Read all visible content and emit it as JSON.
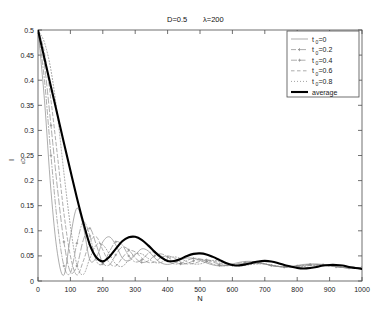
{
  "chart_data": {
    "type": "line",
    "title": "D=0.5  λ=200",
    "title_parts": {
      "d_label": "D=0.5",
      "lambda_label": "λ=200"
    },
    "xlabel": "N",
    "ylabel": "I",
    "ylabel_sub": "εD",
    "xlim": [
      0,
      1000
    ],
    "ylim": [
      0,
      0.5
    ],
    "grid": false,
    "legend_position": "top-right",
    "xticks": [
      0,
      100,
      200,
      300,
      400,
      500,
      600,
      700,
      800,
      900,
      1000
    ],
    "xtick_labels": [
      "0",
      "100",
      "200",
      "300",
      "400",
      "500",
      "600",
      "700",
      "800",
      "900",
      "1000"
    ],
    "yticks": [
      0,
      0.05,
      0.1,
      0.15,
      0.2,
      0.25,
      0.3,
      0.35,
      0.4,
      0.45,
      0.5
    ],
    "ytick_labels": [
      "0",
      "0.05",
      "0.1",
      "0.15",
      "0.2",
      "0.25",
      "0.3",
      "0.35",
      "0.4",
      "0.45",
      "0.5"
    ],
    "x": [
      0,
      20,
      40,
      60,
      80,
      100,
      120,
      140,
      160,
      180,
      200,
      220,
      240,
      260,
      280,
      300,
      320,
      340,
      360,
      380,
      400,
      420,
      440,
      460,
      480,
      500,
      520,
      540,
      560,
      580,
      600,
      620,
      640,
      660,
      680,
      700,
      720,
      740,
      760,
      780,
      800,
      820,
      840,
      860,
      880,
      900,
      920,
      940,
      960,
      980,
      1000
    ],
    "series": [
      {
        "name": "t0=0",
        "label": "t",
        "label_sub": "0",
        "label_rest": "=0",
        "style": "solid-thin",
        "color": "#8a8a8a",
        "values": [
          0.5,
          0.36,
          0.18,
          0.055,
          0.012,
          0.088,
          0.145,
          0.108,
          0.042,
          0.047,
          0.078,
          0.088,
          0.072,
          0.046,
          0.04,
          0.052,
          0.064,
          0.06,
          0.046,
          0.036,
          0.033,
          0.036,
          0.042,
          0.046,
          0.045,
          0.041,
          0.036,
          0.032,
          0.03,
          0.031,
          0.034,
          0.037,
          0.039,
          0.039,
          0.037,
          0.034,
          0.031,
          0.029,
          0.028,
          0.029,
          0.031,
          0.033,
          0.034,
          0.034,
          0.033,
          0.031,
          0.029,
          0.027,
          0.026,
          0.026,
          0.027
        ]
      },
      {
        "name": "t0=0.2",
        "label": "t",
        "label_sub": "0",
        "label_rest": "=0.2",
        "style": "dash-dot",
        "color": "#8a8a8a",
        "values": [
          0.5,
          0.4,
          0.25,
          0.115,
          0.03,
          0.016,
          0.075,
          0.118,
          0.09,
          0.04,
          0.034,
          0.058,
          0.078,
          0.072,
          0.05,
          0.038,
          0.042,
          0.055,
          0.058,
          0.05,
          0.04,
          0.034,
          0.035,
          0.041,
          0.045,
          0.044,
          0.039,
          0.034,
          0.031,
          0.03,
          0.032,
          0.035,
          0.037,
          0.038,
          0.037,
          0.034,
          0.031,
          0.029,
          0.028,
          0.028,
          0.03,
          0.032,
          0.033,
          0.033,
          0.032,
          0.03,
          0.028,
          0.027,
          0.026,
          0.026,
          0.027
        ]
      },
      {
        "name": "t0=0.4",
        "label": "t",
        "label_sub": "0",
        "label_rest": "=0.4",
        "style": "dash-marker",
        "color": "#8a8a8a",
        "values": [
          0.5,
          0.43,
          0.31,
          0.185,
          0.078,
          0.018,
          0.03,
          0.082,
          0.105,
          0.072,
          0.036,
          0.032,
          0.052,
          0.068,
          0.062,
          0.046,
          0.037,
          0.04,
          0.05,
          0.054,
          0.048,
          0.039,
          0.034,
          0.035,
          0.04,
          0.043,
          0.042,
          0.038,
          0.033,
          0.031,
          0.031,
          0.033,
          0.035,
          0.036,
          0.036,
          0.034,
          0.031,
          0.029,
          0.028,
          0.028,
          0.029,
          0.031,
          0.032,
          0.032,
          0.032,
          0.03,
          0.029,
          0.027,
          0.026,
          0.026,
          0.027
        ]
      },
      {
        "name": "t0=0.6",
        "label": "t",
        "label_sub": "0",
        "label_rest": "=0.6",
        "style": "dashed",
        "color": "#8a8a8a",
        "values": [
          0.5,
          0.455,
          0.36,
          0.25,
          0.135,
          0.05,
          0.012,
          0.04,
          0.078,
          0.088,
          0.062,
          0.036,
          0.03,
          0.046,
          0.06,
          0.058,
          0.046,
          0.037,
          0.038,
          0.047,
          0.05,
          0.046,
          0.038,
          0.034,
          0.035,
          0.039,
          0.042,
          0.04,
          0.036,
          0.032,
          0.031,
          0.032,
          0.034,
          0.035,
          0.035,
          0.034,
          0.031,
          0.029,
          0.028,
          0.028,
          0.029,
          0.03,
          0.031,
          0.032,
          0.031,
          0.03,
          0.029,
          0.027,
          0.026,
          0.026,
          0.027
        ]
      },
      {
        "name": "t0=0.8",
        "label": "t",
        "label_sub": "0",
        "label_rest": "=0.8",
        "style": "dotted",
        "color": "#8a8a8a",
        "values": [
          0.5,
          0.475,
          0.42,
          0.33,
          0.215,
          0.11,
          0.032,
          0.013,
          0.045,
          0.072,
          0.072,
          0.054,
          0.034,
          0.029,
          0.042,
          0.054,
          0.054,
          0.045,
          0.037,
          0.037,
          0.044,
          0.048,
          0.045,
          0.038,
          0.034,
          0.034,
          0.038,
          0.041,
          0.039,
          0.035,
          0.032,
          0.03,
          0.031,
          0.033,
          0.034,
          0.034,
          0.032,
          0.03,
          0.028,
          0.028,
          0.028,
          0.029,
          0.031,
          0.031,
          0.031,
          0.03,
          0.029,
          0.027,
          0.026,
          0.026,
          0.026
        ]
      },
      {
        "name": "average",
        "label": "average",
        "label_sub": "",
        "label_rest": "",
        "style": "solid-thick",
        "color": "#000000",
        "values": [
          0.5,
          0.443,
          0.387,
          0.331,
          0.275,
          0.22,
          0.166,
          0.116,
          0.072,
          0.047,
          0.039,
          0.048,
          0.064,
          0.079,
          0.087,
          0.088,
          0.082,
          0.071,
          0.058,
          0.047,
          0.04,
          0.04,
          0.044,
          0.05,
          0.054,
          0.055,
          0.053,
          0.048,
          0.042,
          0.036,
          0.032,
          0.031,
          0.033,
          0.036,
          0.039,
          0.04,
          0.039,
          0.036,
          0.032,
          0.029,
          0.026,
          0.025,
          0.026,
          0.028,
          0.031,
          0.032,
          0.032,
          0.031,
          0.028,
          0.026,
          0.024
        ]
      }
    ]
  },
  "legend": {
    "entries": [
      {
        "label": "t",
        "sub": "0",
        "rest": "=0",
        "style": "solid-thin"
      },
      {
        "label": "t",
        "sub": "0",
        "rest": "=0.2",
        "style": "dash-dot"
      },
      {
        "label": "t",
        "sub": "0",
        "rest": "=0.4",
        "style": "dash-marker"
      },
      {
        "label": "t",
        "sub": "0",
        "rest": "=0.6",
        "style": "dashed"
      },
      {
        "label": "t",
        "sub": "0",
        "rest": "=0.8",
        "style": "dotted"
      },
      {
        "label": "average",
        "sub": "",
        "rest": "",
        "style": "solid-thick"
      }
    ]
  }
}
